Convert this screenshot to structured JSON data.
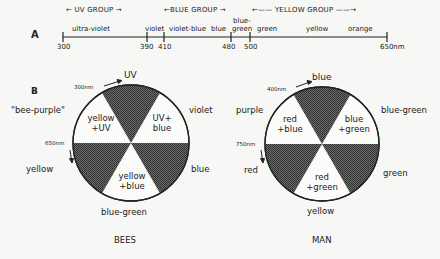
{
  "panel_a": {
    "label": "A",
    "groups": [
      {
        "name": "uv_group",
        "text": "← UV  GROUP →"
      },
      {
        "name": "blue_group",
        "text": "←BLUE GROUP →"
      },
      {
        "name": "yellow_group",
        "text": "←——  YELLOW  GROUP ——→"
      }
    ],
    "bands": [
      "ultra-violet",
      "violet",
      "violet-blue",
      "blue",
      "blue-",
      "green",
      "green",
      "yellow",
      "orange"
    ],
    "ticks": [
      "300",
      "390",
      "410",
      "480",
      "500",
      "650nm"
    ]
  },
  "panel_b": {
    "label": "B",
    "bees": {
      "title": "BEES",
      "outer": {
        "top": "UV",
        "top_nm": "300nm",
        "upper_left": "\"bee-purple\"",
        "upper_right": "violet",
        "left_nm": "650nm",
        "lower_left": "yellow",
        "lower_right": "blue",
        "bottom": "blue-green"
      },
      "segments": {
        "upper_left_1": "yellow",
        "upper_left_2": "+UV",
        "upper_right_1": "UV+",
        "upper_right_2": "blue",
        "bottom_1": "yellow",
        "bottom_2": "+blue"
      }
    },
    "man": {
      "title": "MAN",
      "outer": {
        "top": "blue",
        "top_nm": "400nm",
        "upper_left": "purple",
        "upper_right": "blue-green",
        "left_nm": "750nm",
        "lower_left": "red",
        "lower_right": "green",
        "bottom": "yellow"
      },
      "segments": {
        "upper_left_1": "red",
        "upper_left_2": "+blue",
        "upper_right_1": "blue",
        "upper_right_2": "+green",
        "bottom_1": "red",
        "bottom_2": "+green"
      }
    }
  },
  "colors": {
    "ink": "#222222",
    "shade": "#555555",
    "paper": "#f7f7f5"
  }
}
